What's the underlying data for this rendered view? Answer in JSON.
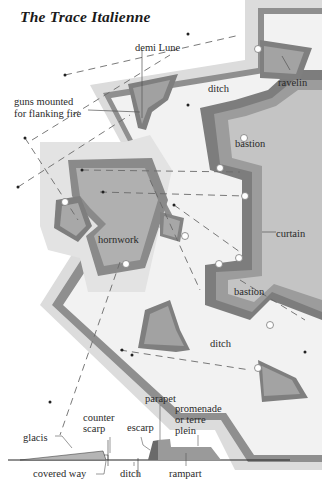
{
  "title": "The Trace Italienne",
  "colors": {
    "background": "#ffffff",
    "glacis_outer": "#d9d9d9",
    "outer_wall": "#8e8e8e",
    "ditch": "#efefef",
    "rampart_dark": "#7c7c7c",
    "rampart_mid": "#9a9a9a",
    "interior": "#c6c6c6",
    "outwork_fill": "#a6a6a6",
    "text": "#2a2a2a"
  },
  "plan_labels": {
    "demi_lune": "demi Lune",
    "guns_line1": "guns mounted",
    "guns_line2": "for flanking fire",
    "ditch_top": "ditch",
    "ravelin": "ravelin",
    "bastion_top": "bastion",
    "curtain": "curtain",
    "hornwork": "hornwork",
    "bastion_bottom": "bastion",
    "ditch_bottom": "ditch"
  },
  "section_labels": {
    "parapet": "parapet",
    "promenade_line1": "promenade",
    "promenade_line2": "or terre",
    "promenade_line3": "plein",
    "counter_line1": "counter",
    "counter_line2": "scarp",
    "escarp": "escarp",
    "glacis": "glacis",
    "covered_way": "covered way",
    "ditch": "ditch",
    "rampart": "rampart"
  }
}
